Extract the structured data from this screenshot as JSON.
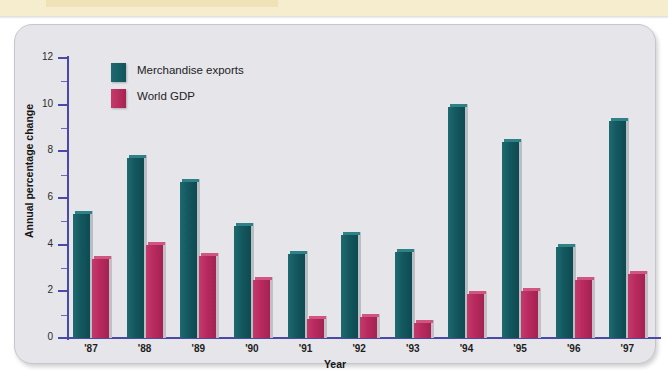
{
  "banner": {
    "strip_label": ""
  },
  "chart_data": {
    "type": "bar",
    "title": "",
    "xlabel": "Year",
    "ylabel": "Annual percentage change",
    "categories": [
      "'87",
      "'88",
      "'89",
      "'90",
      "'91",
      "'92",
      "'93",
      "'94",
      "'95",
      "'96",
      "'97"
    ],
    "ylim": [
      0,
      12
    ],
    "yticks": [
      0,
      2,
      4,
      6,
      8,
      10,
      12
    ],
    "ytick_labels": [
      "0",
      "2",
      "4",
      "6",
      "8",
      "10",
      "12"
    ],
    "minor_ticks": [
      1,
      3,
      5,
      7,
      9,
      11
    ],
    "grid": false,
    "legend_position": "top-left-inside",
    "series": [
      {
        "name": "Merchandise exports",
        "color": "#14585f",
        "values": [
          5.3,
          7.7,
          6.7,
          4.8,
          3.6,
          4.4,
          3.7,
          9.9,
          8.4,
          3.9,
          9.3
        ]
      },
      {
        "name": "World GDP",
        "color": "#b82a5e",
        "values": [
          3.4,
          4.0,
          3.5,
          2.5,
          0.8,
          0.9,
          0.65,
          1.9,
          2.0,
          2.5,
          2.75
        ]
      }
    ]
  },
  "colors": {
    "axis": "#4a49a8",
    "panel": "#e6e5ea",
    "banner": "#f6edcf",
    "exports": "#14585f",
    "gdp": "#b82a5e"
  }
}
